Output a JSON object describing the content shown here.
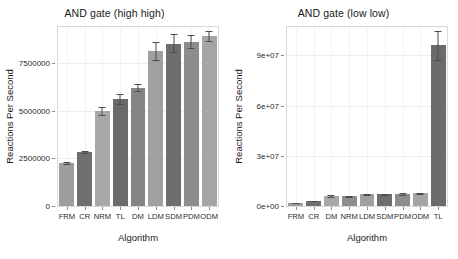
{
  "figure": {
    "background": "#ffffff",
    "panel_border_color": "#d8d8d8",
    "gridline_color": "#ededed"
  },
  "chart_data": [
    {
      "type": "bar",
      "title": "AND gate (high high)",
      "xlabel": "Algorithm",
      "ylabel": "Reactions Per Second",
      "categories": [
        "FRM",
        "CR",
        "NRM",
        "TL",
        "DM",
        "LDM",
        "SDM",
        "PDM",
        "ODM"
      ],
      "values": [
        2250000,
        2820000,
        4990000,
        5600000,
        6200000,
        8150000,
        8530000,
        8620000,
        8920000
      ],
      "errors_low": [
        2180000,
        2760000,
        4790000,
        5340000,
        6020000,
        7680000,
        8080000,
        8280000,
        8690000
      ],
      "errors_high": [
        2320000,
        2880000,
        5190000,
        5880000,
        6410000,
        8600000,
        9010000,
        8990000,
        9170000
      ],
      "bar_colors": [
        "#9d9d9d",
        "#6f6f6f",
        "#a8a8a8",
        "#6b6b6b",
        "#858585",
        "#a0a0a0",
        "#6e6e6e",
        "#8d8d8d",
        "#a5a5a5"
      ],
      "error_color": "#4d4d4d",
      "ylim": [
        0,
        9400000
      ],
      "yticks": [
        0,
        2500000,
        5000000,
        7500000
      ],
      "ytick_labels": [
        "0",
        "2500000",
        "5000000",
        "7500000"
      ],
      "grid": true,
      "legend": "none"
    },
    {
      "type": "bar",
      "title": "AND gate (low low)",
      "xlabel": "Algorithm",
      "ylabel": "Reactions Per Second",
      "categories": [
        "FRM",
        "CR",
        "DM",
        "NRM",
        "LDM",
        "SDM",
        "PDM",
        "ODM",
        "TL"
      ],
      "values": [
        1900000,
        3100000,
        6000000,
        5700000,
        7000000,
        6900000,
        7100000,
        7600000,
        96000000
      ],
      "errors_low": [
        1750000,
        2950000,
        5600000,
        5400000,
        6600000,
        6500000,
        6700000,
        7200000,
        87500000
      ],
      "errors_high": [
        2050000,
        3250000,
        6400000,
        6000000,
        7400000,
        7300000,
        7500000,
        8000000,
        104500000
      ],
      "bar_colors": [
        "#9d9d9d",
        "#6f6f6f",
        "#a8a8a8",
        "#8f8f8f",
        "#a0a0a0",
        "#6e6e6e",
        "#8d8d8d",
        "#a5a5a5",
        "#6b6b6b"
      ],
      "error_color": "#4d4d4d",
      "ylim": [
        0,
        107000000
      ],
      "yticks": [
        0,
        30000000,
        60000000,
        90000000
      ],
      "ytick_labels": [
        "0e+00",
        "3e+07",
        "6e+07",
        "9e+07"
      ],
      "grid": true,
      "legend": "none"
    }
  ]
}
